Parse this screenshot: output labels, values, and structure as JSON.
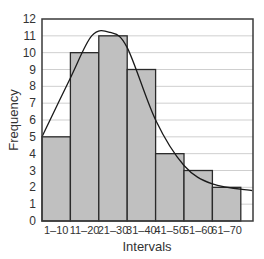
{
  "chart_data": {
    "type": "bar",
    "subtype": "histogram",
    "title": "",
    "xlabel": "Intervals",
    "ylabel": "Frequency",
    "categories": [
      "1–10",
      "11–20",
      "21–30",
      "31–40",
      "41–50",
      "51–60",
      "61–70"
    ],
    "values": [
      5,
      10,
      11,
      9,
      4,
      3,
      2
    ],
    "ylim": [
      0,
      12
    ],
    "yticks": [
      0,
      1,
      2,
      3,
      4,
      5,
      6,
      7,
      8,
      9,
      10,
      11,
      12
    ],
    "grid": {
      "horizontal": true,
      "vertical": false
    },
    "overlay": {
      "type": "line",
      "description": "smooth frequency curve (normal-like)",
      "approx_points": [
        [
          0,
          5
        ],
        [
          1,
          8.5
        ],
        [
          1.75,
          11
        ],
        [
          2.4,
          11.2
        ],
        [
          3,
          10.3
        ],
        [
          4,
          6
        ],
        [
          5,
          3.3
        ],
        [
          6,
          2.2
        ],
        [
          7.4,
          1.8
        ]
      ]
    },
    "legend": null
  },
  "axis": {
    "ylabel": "Frequency",
    "xlabel": "Intervals",
    "yticks": [
      "0",
      "1",
      "2",
      "3",
      "4",
      "5",
      "6",
      "7",
      "8",
      "9",
      "10",
      "11",
      "12"
    ],
    "xticks": [
      "1–10",
      "11–20",
      "21–30",
      "31–40",
      "41–50",
      "51–60",
      "61–70"
    ]
  },
  "colors": {
    "bar_fill": "#c0c0c0",
    "bar_stroke": "#2a2a2a",
    "grid": "#cfcfcf",
    "frame": "#3a3a3a",
    "curve": "#1a1a1a"
  }
}
